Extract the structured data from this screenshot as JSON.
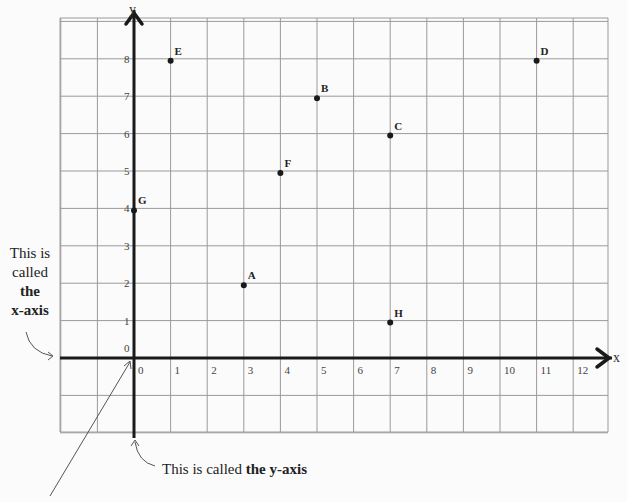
{
  "chart_data": {
    "type": "scatter",
    "title": "",
    "xlabel": "x",
    "ylabel": "y",
    "xlim": [
      -2,
      13
    ],
    "ylim": [
      -2,
      9
    ],
    "grid": true,
    "x_ticks": [
      "0",
      "1",
      "2",
      "3",
      "4",
      "5",
      "6",
      "7",
      "8",
      "9",
      "10",
      "11",
      "12"
    ],
    "y_ticks": [
      "0",
      "1",
      "2",
      "3",
      "4",
      "5",
      "6",
      "7",
      "8"
    ],
    "points": [
      {
        "label": "A",
        "x": 3,
        "y": 2
      },
      {
        "label": "B",
        "x": 5,
        "y": 7
      },
      {
        "label": "C",
        "x": 7,
        "y": 6
      },
      {
        "label": "D",
        "x": 11,
        "y": 8
      },
      {
        "label": "E",
        "x": 1,
        "y": 8
      },
      {
        "label": "F",
        "x": 4,
        "y": 5
      },
      {
        "label": "G",
        "x": 0,
        "y": 4
      },
      {
        "label": "H",
        "x": 7,
        "y": 1
      }
    ]
  },
  "axes": {
    "x_label": "x",
    "y_label": "y"
  },
  "annotations": {
    "x_axis_note": {
      "line1": "This is",
      "line2": "called",
      "line3": "the",
      "line4": "x-axis"
    },
    "y_axis_note": {
      "prefix": "This is called ",
      "bold": "the y-axis"
    }
  },
  "colors": {
    "grid": "#9a9a9a",
    "axis": "#1a1a1a",
    "point": "#1a1a1a",
    "background": "#fbfbfb"
  }
}
